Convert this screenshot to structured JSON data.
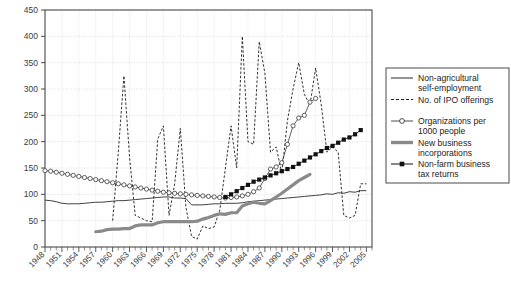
{
  "chart_data": {
    "type": "line",
    "title": "",
    "xlabel": "",
    "ylabel": "",
    "xlim": [
      1948,
      2006
    ],
    "ylim": [
      0,
      450
    ],
    "yticks": [
      0,
      50,
      100,
      150,
      200,
      250,
      300,
      350,
      400,
      450
    ],
    "xticks": [
      1948,
      1951,
      1954,
      1957,
      1960,
      1963,
      1966,
      1969,
      1972,
      1975,
      1978,
      1981,
      1984,
      1987,
      1990,
      1993,
      1996,
      1999,
      2002,
      2005
    ],
    "grid": true,
    "legend_position": "right",
    "series": [
      {
        "name": "Non-agricultural self-employment",
        "style": "thin-solid",
        "color": "#2b2b2b",
        "x": [
          1948,
          1949,
          1950,
          1951,
          1952,
          1953,
          1954,
          1955,
          1956,
          1957,
          1958,
          1959,
          1960,
          1961,
          1962,
          1963,
          1964,
          1965,
          1966,
          1967,
          1968,
          1969,
          1970,
          1971,
          1972,
          1973,
          1974,
          1975,
          1976,
          1977,
          1978,
          1979,
          1980,
          1981,
          1982,
          1983,
          1984,
          1985,
          1986,
          1987,
          1988,
          1989,
          1990,
          1991,
          1992,
          1993,
          1994,
          1995,
          1996,
          1997,
          1998,
          1999,
          2000,
          2001,
          2002,
          2003,
          2004,
          2005
        ],
        "values": [
          89,
          88,
          86,
          83,
          82,
          82,
          82,
          83,
          84,
          85,
          85,
          86,
          87,
          88,
          88,
          89,
          90,
          91,
          92,
          93,
          94,
          95,
          95,
          93,
          93,
          92,
          80,
          80,
          80,
          81,
          82,
          82,
          83,
          83,
          83,
          84,
          86,
          87,
          88,
          89,
          90,
          91,
          92,
          93,
          94,
          95,
          96,
          97,
          98,
          99,
          101,
          100,
          103,
          102,
          105,
          104,
          107,
          107
        ]
      },
      {
        "name": "No. of IPO offerings",
        "style": "dashed",
        "color": "#1c1c1c",
        "x": [
          1960,
          1961,
          1962,
          1963,
          1964,
          1965,
          1966,
          1967,
          1968,
          1969,
          1970,
          1971,
          1972,
          1973,
          1974,
          1975,
          1976,
          1977,
          1978,
          1979,
          1980,
          1981,
          1982,
          1983,
          1984,
          1985,
          1986,
          1987,
          1988,
          1989,
          1990,
          1991,
          1992,
          1993,
          1994,
          1995,
          1996,
          1997,
          1998,
          1999,
          2000,
          2001,
          2002,
          2003,
          2004,
          2005
        ],
        "values": [
          50,
          180,
          325,
          170,
          60,
          55,
          50,
          48,
          205,
          230,
          60,
          120,
          225,
          75,
          20,
          15,
          40,
          35,
          38,
          70,
          150,
          230,
          150,
          400,
          200,
          195,
          390,
          330,
          180,
          190,
          140,
          240,
          300,
          350,
          290,
          270,
          340,
          270,
          180,
          190,
          180,
          60,
          55,
          60,
          120,
          120
        ]
      },
      {
        "name": "Organizations per 1000 people",
        "style": "circle-marker",
        "color": "#3a3a3a",
        "x": [
          1948,
          1949,
          1950,
          1951,
          1952,
          1953,
          1954,
          1955,
          1956,
          1957,
          1958,
          1959,
          1960,
          1961,
          1962,
          1963,
          1964,
          1965,
          1966,
          1967,
          1968,
          1969,
          1970,
          1971,
          1972,
          1973,
          1974,
          1975,
          1976,
          1977,
          1978,
          1979,
          1980,
          1981,
          1982,
          1983,
          1984,
          1985,
          1986,
          1987,
          1988,
          1989,
          1990,
          1991,
          1992,
          1993,
          1994,
          1995,
          1996
        ],
        "values": [
          145,
          144,
          142,
          140,
          138,
          136,
          134,
          132,
          130,
          128,
          126,
          124,
          122,
          120,
          118,
          116,
          114,
          112,
          110,
          108,
          106,
          104,
          103,
          102,
          101,
          100,
          99,
          98,
          97,
          96,
          95,
          94,
          93,
          94,
          95,
          97,
          100,
          105,
          112,
          130,
          148,
          152,
          160,
          195,
          230,
          245,
          250,
          275,
          282
        ]
      },
      {
        "name": "New business incorporations",
        "style": "thick-solid",
        "color": "#8a8a8a",
        "x": [
          1957,
          1958,
          1959,
          1960,
          1961,
          1962,
          1963,
          1964,
          1965,
          1966,
          1967,
          1968,
          1969,
          1970,
          1971,
          1972,
          1973,
          1974,
          1975,
          1976,
          1977,
          1978,
          1979,
          1980,
          1981,
          1982,
          1983,
          1984,
          1985,
          1986,
          1987,
          1988,
          1989,
          1990,
          1991,
          1992,
          1993,
          1994,
          1995
        ],
        "values": [
          29,
          30,
          33,
          34,
          34,
          35,
          35,
          40,
          42,
          42,
          42,
          46,
          48,
          48,
          48,
          48,
          48,
          48,
          49,
          53,
          56,
          60,
          63,
          62,
          65,
          65,
          78,
          82,
          85,
          83,
          82,
          88,
          95,
          102,
          110,
          118,
          126,
          132,
          138
        ]
      },
      {
        "name": "Non-farm business tax returns",
        "style": "square-marker",
        "color": "#111111",
        "x": [
          1980,
          1981,
          1982,
          1983,
          1984,
          1985,
          1986,
          1987,
          1988,
          1989,
          1990,
          1991,
          1992,
          1993,
          1994,
          1995,
          1996,
          1997,
          1998,
          1999,
          2000,
          2001,
          2002,
          2003,
          2004
        ],
        "values": [
          95,
          100,
          106,
          112,
          118,
          124,
          128,
          132,
          136,
          140,
          144,
          148,
          152,
          158,
          164,
          170,
          176,
          182,
          188,
          192,
          198,
          204,
          208,
          214,
          222
        ]
      }
    ]
  },
  "axes": {
    "yticks": [
      "0",
      "50",
      "100",
      "150",
      "200",
      "250",
      "300",
      "350",
      "400",
      "450"
    ],
    "xticks": [
      "1948",
      "1951",
      "1954",
      "1957",
      "1960",
      "1963",
      "1966",
      "1969",
      "1972",
      "1975",
      "1978",
      "1981",
      "1984",
      "1987",
      "1990",
      "1993",
      "1996",
      "1999",
      "2002",
      "2005"
    ]
  },
  "legend": {
    "items": [
      {
        "label_line1": "Non-agricultural",
        "label_line2": "self-employment",
        "style": "thin-solid"
      },
      {
        "label_line1": "No. of IPO offerings",
        "label_line2": "",
        "style": "dashed"
      },
      {
        "label_line1": "Organizations per",
        "label_line2": "1000 people",
        "style": "circle-marker"
      },
      {
        "label_line1": "New business",
        "label_line2": "incorporations",
        "style": "thick-solid"
      },
      {
        "label_line1": "Non-farm business",
        "label_line2": "tax returns",
        "style": "square-marker"
      }
    ]
  },
  "colors": {
    "axis": "#4a4a4a",
    "grid": "#cfcfcf",
    "thin_line": "#2b2b2b",
    "dashed_line": "#1c1c1c",
    "circle_line": "#3a3a3a",
    "thick_line": "#8a8a8a",
    "square_line": "#111111",
    "text": "#3b3b3b"
  }
}
